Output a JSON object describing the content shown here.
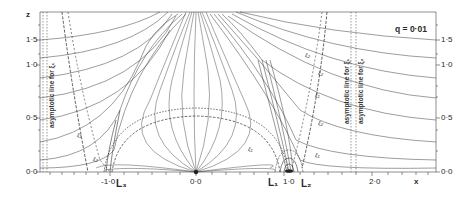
{
  "figure": {
    "parameter": "q = 0·01",
    "axes": {
      "x_label": "x",
      "z_label": "z",
      "x_ticks": [
        "-1·0",
        "0·0",
        "1·0",
        "2·0"
      ],
      "z_ticks_left": [
        "0·0",
        "0·5",
        "1·0",
        "1·5"
      ],
      "z_ticks_right": [
        "0·0",
        "0·5",
        "1·0",
        "1·5"
      ]
    },
    "points": {
      "L1": "L₁",
      "L2": "L₂",
      "L3": "L₃"
    },
    "annotations": {
      "left_asymptote": "asymptotic line for ξ₁",
      "right_asymptote_1": "asymptotic line for ξ₁",
      "right_asymptote_2": "asymptotic line for ξ₂",
      "curve_labels": [
        "ξ₁",
        "ξ₂",
        "ξ₁",
        "ξ₂",
        "ξ₁",
        "ξ₂",
        "ξ₁",
        "ξ₂"
      ]
    },
    "colors": {
      "line": "#3a3a3a",
      "background": "#ffffff"
    }
  }
}
